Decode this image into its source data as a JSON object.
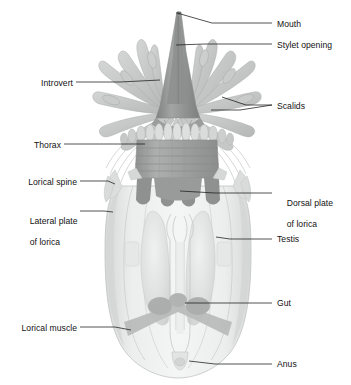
{
  "figure": {
    "organism": "Nanaloricus (Loricifera)",
    "view": "dorsal view, whole animal",
    "background_color": "#ffffff",
    "line_color": "#1a1a1a"
  },
  "palette": {
    "outline": "#b9b9b9",
    "lorica_light": "#eceded",
    "lorica_mid": "#e0e1e1",
    "lorica_shadow": "#d2d3d3",
    "plate_dark": "#8e8f8f",
    "plate_mid": "#a8a9a9",
    "cone_dark": "#8b8c8c",
    "cone_mid": "#9c9d9d",
    "scalid_light": "#cfd0d0",
    "scalid_mid": "#bcbdbd",
    "thorax_mid": "#a3a4a4",
    "thorax_dark": "#919292",
    "muscle": "#b4b5b5",
    "gut_fill": "#f2f3f3",
    "testis": "#dcdddd",
    "placid": "#d8d9d9"
  },
  "labels": [
    {
      "id": "mouth",
      "text": "Mouth",
      "side": "right",
      "x": 277,
      "y": 19,
      "lines": [
        "Mouth"
      ]
    },
    {
      "id": "stylet-opening",
      "text": "Stylet opening",
      "side": "right",
      "x": 277,
      "y": 40,
      "lines": [
        "Stylet opening"
      ]
    },
    {
      "id": "scalids",
      "text": "Scalids",
      "side": "right",
      "x": 277,
      "y": 101,
      "lines": [
        "Scalids"
      ]
    },
    {
      "id": "dorsal-plate-of-lorica",
      "text": "Dorsal plate of lorica",
      "side": "right",
      "x": 277,
      "y": 188,
      "lines": [
        "Dorsal plate",
        "of lorica"
      ]
    },
    {
      "id": "testis",
      "text": "Testis",
      "side": "right",
      "x": 277,
      "y": 234,
      "lines": [
        "Testis"
      ]
    },
    {
      "id": "gut",
      "text": "Gut",
      "side": "right",
      "x": 277,
      "y": 298,
      "lines": [
        "Gut"
      ]
    },
    {
      "id": "anus",
      "text": "Anus",
      "side": "right",
      "x": 277,
      "y": 359,
      "lines": [
        "Anus"
      ]
    },
    {
      "id": "introvert",
      "text": "Introvert",
      "side": "left",
      "x": 20,
      "y": 78,
      "lines": [
        "Introvert"
      ]
    },
    {
      "id": "thorax",
      "text": "Thorax",
      "side": "left",
      "x": 20,
      "y": 140,
      "lines": [
        "Thorax"
      ]
    },
    {
      "id": "lorical-spine",
      "text": "Lorical spine",
      "side": "left",
      "x": 20,
      "y": 177,
      "lines": [
        "Lorical spine"
      ]
    },
    {
      "id": "lateral-plate-of-lorica",
      "text": "Lateral plate of lorica",
      "side": "left",
      "x": 20,
      "y": 206,
      "lines": [
        "Lateral plate",
        "of lorica"
      ]
    },
    {
      "id": "lorical-muscle",
      "text": "Lorical muscle",
      "side": "left",
      "x": 20,
      "y": 323,
      "lines": [
        "Lorical muscle"
      ]
    }
  ],
  "leaders": [
    {
      "id": "leader-mouth",
      "label": "mouth",
      "points": "272,23 212,23 177,13"
    },
    {
      "id": "leader-stylet-opening",
      "label": "stylet-opening",
      "points": "272,44 205,44 176,45"
    },
    {
      "id": "leader-scalids-upper",
      "label": "scalids",
      "points": "272,105 246,105 222,97"
    },
    {
      "id": "leader-scalids-lower",
      "label": "scalids",
      "points": "272,105 240,110 211,110"
    },
    {
      "id": "leader-dorsal-plate",
      "label": "dorsal-plate-of-lorica",
      "points": "272,193 215,193 180,191"
    },
    {
      "id": "leader-testis",
      "label": "testis",
      "points": "272,239 230,239 216,237"
    },
    {
      "id": "leader-gut",
      "label": "gut",
      "points": "272,303 215,303 185,303"
    },
    {
      "id": "leader-anus",
      "label": "anus",
      "points": "272,364 215,364 189,361"
    },
    {
      "id": "leader-introvert",
      "label": "introvert",
      "points": "76,82 120,82 160,80"
    },
    {
      "id": "leader-thorax",
      "label": "thorax",
      "points": "64,144 110,144 145,144"
    },
    {
      "id": "leader-lorical-spine",
      "label": "lorical-spine",
      "points": "80,181 108,181 115,184"
    },
    {
      "id": "leader-lateral-plate",
      "label": "lateral-plate-of-lorica",
      "points": "80,211 104,211 113,212"
    },
    {
      "id": "leader-lorical-muscle",
      "label": "lorical-muscle",
      "points": "80,327 115,327 131,330"
    }
  ],
  "anatomy": {
    "mouth_cone": {
      "name": "mouth cone with stylet",
      "apex_x": 177,
      "apex_y": 12,
      "base_y": 112
    },
    "scalids": {
      "name": "scalids",
      "count": 26,
      "description": "club-shaped appendages radiating from the introvert"
    },
    "placids": {
      "name": "placids",
      "count": 13,
      "description": "row of oval plates at the top of the thorax"
    },
    "thorax": {
      "name": "thorax",
      "band_count": 5,
      "top_y": 130,
      "bottom_y": 178
    },
    "lorical_spines": {
      "name": "lorical spines",
      "count": 4
    },
    "lorica": {
      "name": "lorica",
      "top_y": 176,
      "bottom_y": 370,
      "left_x": 105,
      "right_x": 250
    },
    "testes": {
      "name": "testis",
      "count": 2
    },
    "gut": {
      "name": "gut",
      "top_y": 212,
      "bottom_y": 358
    },
    "anus": {
      "name": "anus",
      "x": 186,
      "y": 362
    },
    "lorical_muscles": {
      "name": "lorical muscle",
      "count": 2
    }
  }
}
